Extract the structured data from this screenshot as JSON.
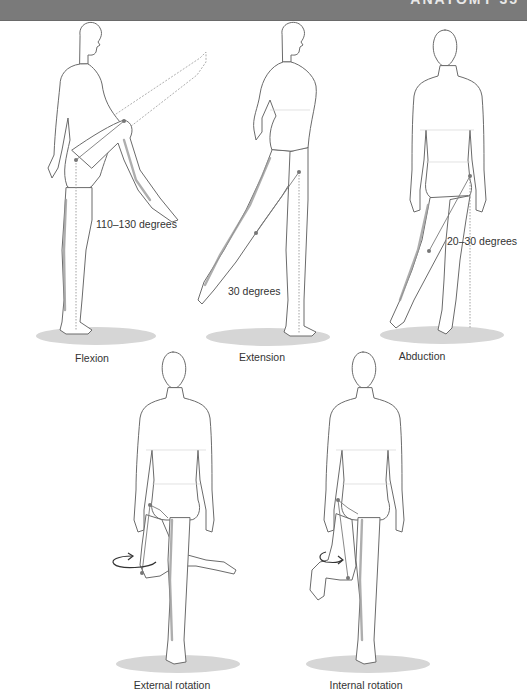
{
  "header": {
    "text": "ANATOMY  35",
    "bar_color": "#7a7a7a"
  },
  "figures": [
    {
      "id": "flexion",
      "label": "Flexion",
      "angle_label": "110–130 degrees"
    },
    {
      "id": "extension",
      "label": "Extension",
      "angle_label": "30 degrees"
    },
    {
      "id": "abduction",
      "label": "Abduction",
      "angle_label": "20–30 degrees"
    },
    {
      "id": "external-rotation",
      "label": "External rotation",
      "angle_label": ""
    },
    {
      "id": "internal-rotation",
      "label": "Internal rotation",
      "angle_label": ""
    }
  ],
  "colors": {
    "outline": "#6b6b6b",
    "shadow": "#d6d6d6",
    "joint": "#777777",
    "text": "#333333"
  }
}
